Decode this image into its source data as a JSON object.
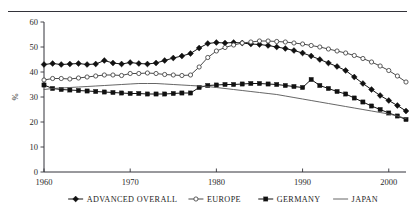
{
  "chart_data": {
    "type": "line",
    "title": "",
    "xlabel": "",
    "ylabel": "%",
    "xlim": [
      1960,
      2002
    ],
    "ylim": [
      0,
      60
    ],
    "grid": false,
    "legend_position": "bottom",
    "xticks": [
      "1960",
      "1970",
      "1980",
      "1990",
      "2000"
    ],
    "xtick_values": [
      1960,
      1970,
      1980,
      1990,
      2000
    ],
    "yticks": [
      "0",
      "10",
      "20",
      "30",
      "40",
      "50",
      "60"
    ],
    "ytick_values": [
      0,
      10,
      20,
      30,
      40,
      50,
      60
    ],
    "x": [
      1960,
      1961,
      1962,
      1963,
      1964,
      1965,
      1966,
      1967,
      1968,
      1969,
      1970,
      1971,
      1972,
      1973,
      1974,
      1975,
      1976,
      1977,
      1978,
      1979,
      1980,
      1981,
      1982,
      1983,
      1984,
      1985,
      1986,
      1987,
      1988,
      1989,
      1990,
      1991,
      1992,
      1993,
      1994,
      1995,
      1996,
      1997,
      1998,
      1999,
      2000,
      2001,
      2002
    ],
    "series": [
      {
        "name": "ADVANCED OVERALL",
        "marker": "filled-diamond",
        "color": "#111111",
        "values": [
          43.0,
          43.4,
          43.0,
          43.2,
          43.4,
          43.0,
          43.2,
          44.6,
          43.6,
          43.2,
          43.8,
          43.4,
          43.2,
          43.6,
          44.6,
          45.6,
          46.4,
          47.4,
          49.6,
          51.4,
          51.8,
          51.6,
          51.8,
          51.6,
          51.2,
          51.0,
          50.6,
          50.0,
          49.4,
          48.6,
          47.6,
          46.4,
          45.0,
          43.6,
          42.2,
          40.6,
          38.0,
          35.4,
          33.0,
          30.6,
          28.6,
          26.6,
          24.4
        ]
      },
      {
        "name": "EUROPE",
        "marker": "open-circle",
        "color": "#4a4a4a",
        "values": [
          36.8,
          37.4,
          37.4,
          37.2,
          37.6,
          38.0,
          38.4,
          38.8,
          38.8,
          38.6,
          39.4,
          39.4,
          39.6,
          39.4,
          39.0,
          38.8,
          38.6,
          38.8,
          42.0,
          45.8,
          48.4,
          49.8,
          50.8,
          51.6,
          52.0,
          52.4,
          52.4,
          52.2,
          52.0,
          51.6,
          51.2,
          50.6,
          50.0,
          49.2,
          48.4,
          47.6,
          46.6,
          45.4,
          44.0,
          42.4,
          40.6,
          38.4,
          36.0
        ]
      },
      {
        "name": "GERMANY",
        "marker": "filled-square",
        "color": "#111111",
        "values": [
          34.8,
          33.4,
          33.0,
          32.8,
          32.6,
          32.4,
          32.2,
          32.0,
          31.8,
          31.6,
          31.4,
          31.4,
          31.2,
          31.2,
          31.2,
          31.4,
          31.6,
          31.6,
          33.8,
          34.6,
          34.8,
          35.0,
          35.0,
          35.2,
          35.4,
          35.4,
          35.2,
          35.0,
          34.6,
          34.2,
          33.8,
          37.0,
          34.6,
          33.4,
          32.2,
          31.2,
          29.6,
          28.0,
          26.4,
          25.0,
          23.6,
          22.4,
          21.0
        ]
      },
      {
        "name": "JAPAN",
        "marker": "none",
        "color": "#555555",
        "values": [
          33.0,
          33.4,
          33.6,
          33.8,
          34.0,
          34.2,
          34.4,
          34.6,
          34.8,
          35.0,
          35.2,
          35.4,
          35.4,
          35.4,
          35.2,
          35.0,
          34.8,
          34.6,
          34.4,
          34.2,
          33.8,
          33.4,
          33.0,
          32.6,
          32.2,
          31.8,
          31.4,
          31.0,
          30.4,
          29.8,
          29.2,
          28.6,
          28.0,
          27.4,
          26.8,
          26.2,
          25.6,
          25.0,
          24.4,
          23.8,
          23.2,
          22.4,
          21.4
        ]
      }
    ]
  }
}
